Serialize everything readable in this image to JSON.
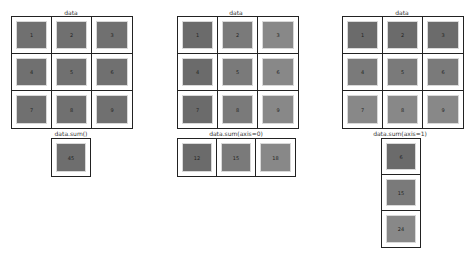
{
  "panels": [
    {
      "data_title": "data",
      "data": [
        [
          1,
          2,
          3
        ],
        [
          4,
          5,
          6
        ],
        [
          7,
          8,
          9
        ]
      ],
      "data_colors": [
        [
          "#707070",
          "#707070",
          "#707070"
        ],
        [
          "#707070",
          "#707070",
          "#707070"
        ],
        [
          "#707070",
          "#707070",
          "#707070"
        ]
      ],
      "result_title": "data.sum()",
      "result": [
        [
          45
        ]
      ],
      "result_colors": [
        [
          "#6e6e6e"
        ]
      ]
    },
    {
      "data_title": "data",
      "data": [
        [
          1,
          2,
          3
        ],
        [
          4,
          5,
          6
        ],
        [
          7,
          8,
          9
        ]
      ],
      "data_colors": [
        [
          "#6b6b6b",
          "#7a7a7a",
          "#888888"
        ],
        [
          "#6b6b6b",
          "#7a7a7a",
          "#888888"
        ],
        [
          "#6b6b6b",
          "#7a7a7a",
          "#888888"
        ]
      ],
      "result_title": "data.sum(axis=0)",
      "result": [
        [
          12,
          15,
          18
        ]
      ],
      "result_colors": [
        [
          "#6b6b6b",
          "#7a7a7a",
          "#888888"
        ]
      ]
    },
    {
      "data_title": "data",
      "data": [
        [
          1,
          2,
          3
        ],
        [
          4,
          5,
          6
        ],
        [
          7,
          8,
          9
        ]
      ],
      "data_colors": [
        [
          "#6b6b6b",
          "#6b6b6b",
          "#6b6b6b"
        ],
        [
          "#7a7a7a",
          "#7a7a7a",
          "#7a7a7a"
        ],
        [
          "#888888",
          "#888888",
          "#888888"
        ]
      ],
      "result_title": "data.sum(axis=1)",
      "result": [
        [
          6
        ],
        [
          15
        ],
        [
          24
        ]
      ],
      "result_colors": [
        [
          "#6b6b6b"
        ],
        [
          "#7a7a7a"
        ],
        [
          "#888888"
        ]
      ]
    }
  ]
}
